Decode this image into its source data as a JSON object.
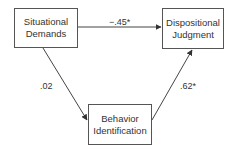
{
  "diagram": {
    "type": "mediation path diagram",
    "nodes": [
      {
        "id": "situational_demands",
        "line1": "Situational",
        "line2": "Demands"
      },
      {
        "id": "dispositional_judgment",
        "line1": "Dispositional",
        "line2": "Judgment"
      },
      {
        "id": "behavior_identification",
        "line1": "Behavior",
        "line2": "Identification"
      }
    ],
    "edges": [
      {
        "from": "situational_demands",
        "to": "dispositional_judgment",
        "label": "−.45*"
      },
      {
        "from": "situational_demands",
        "to": "behavior_identification",
        "label": ".02"
      },
      {
        "from": "behavior_identification",
        "to": "dispositional_judgment",
        "label": ".62*"
      }
    ],
    "colors": {
      "line": "#444444",
      "border": "#555555",
      "background": "#ffffff"
    }
  }
}
